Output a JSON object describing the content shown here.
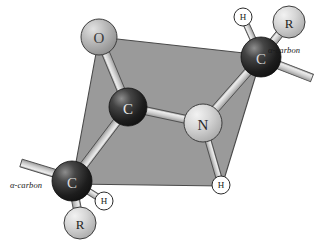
{
  "figure": {
    "type": "molecular-structure-diagram",
    "background_color": "#ffffff"
  },
  "plane": {
    "name": "peptide-plane",
    "fill_color": "#9a9a9a",
    "stroke_color": "#4a4a4a",
    "vertices": [
      [
        99,
        37
      ],
      [
        262,
        55
      ],
      [
        222,
        186
      ],
      [
        72,
        184
      ]
    ]
  },
  "atoms": [
    {
      "id": "o1",
      "label": "O",
      "kind": "oxygen",
      "x": 99,
      "y": 37,
      "r": 18,
      "fill": "#b3b3b3",
      "text_color": "#3a3a3a",
      "style": "sphere"
    },
    {
      "id": "c1",
      "label": "C",
      "kind": "carbonyl-carbon",
      "x": 128,
      "y": 107,
      "r": 19,
      "fill": "#2e2e2e",
      "text_color": "#e8e8e8",
      "style": "sphere-dark"
    },
    {
      "id": "n1",
      "label": "N",
      "kind": "nitrogen",
      "x": 203,
      "y": 123,
      "r": 19,
      "fill": "#c9c9c9",
      "text_color": "#2a2a2a",
      "style": "sphere"
    },
    {
      "id": "ca1",
      "label": "C",
      "kind": "alpha-carbon-upper",
      "x": 261,
      "y": 57,
      "r": 20,
      "fill": "#262626",
      "text_color": "#d8d8d8",
      "style": "sphere-dark"
    },
    {
      "id": "ca2",
      "label": "C",
      "kind": "alpha-carbon-lower",
      "x": 72,
      "y": 181,
      "r": 20,
      "fill": "#262626",
      "text_color": "#d8d8d8",
      "style": "sphere-dark"
    },
    {
      "id": "r1",
      "label": "R",
      "kind": "side-chain-upper",
      "x": 289,
      "y": 22,
      "r": 16,
      "fill": "#d0d0d0",
      "text_color": "#1f1f1f",
      "style": "sphere"
    },
    {
      "id": "r2",
      "label": "R",
      "kind": "side-chain-lower",
      "x": 80,
      "y": 223,
      "r": 16,
      "fill": "#d0d0d0",
      "text_color": "#1f1f1f",
      "style": "sphere"
    },
    {
      "id": "h1",
      "label": "H",
      "kind": "hydrogen-upper-alpha",
      "x": 243,
      "y": 17,
      "r": 9,
      "fill": "#ffffff",
      "text_color": "#1a1a1a",
      "style": "circle"
    },
    {
      "id": "h2",
      "label": "H",
      "kind": "hydrogen-amide",
      "x": 221,
      "y": 185,
      "r": 9,
      "fill": "#ffffff",
      "text_color": "#1a1a1a",
      "style": "circle"
    },
    {
      "id": "h3",
      "label": "H",
      "kind": "hydrogen-lower-alpha",
      "x": 104,
      "y": 201,
      "r": 9,
      "fill": "#ffffff",
      "text_color": "#1a1a1a",
      "style": "circle"
    }
  ],
  "bonds": [
    {
      "from": "c1",
      "to": "o1",
      "order": "double",
      "name": "carbonyl-bond"
    },
    {
      "from": "c1",
      "to": "n1",
      "order": "single",
      "name": "peptide-bond"
    },
    {
      "from": "c1",
      "to": "ca2",
      "order": "single",
      "name": "c-alpha-lower-bond"
    },
    {
      "from": "n1",
      "to": "ca1",
      "order": "single",
      "name": "n-alpha-upper-bond"
    },
    {
      "from": "n1",
      "to": "h2",
      "order": "single",
      "name": "n-h-bond"
    },
    {
      "from": "ca1",
      "to": "h1",
      "order": "single",
      "name": "alpha-upper-h-bond"
    },
    {
      "from": "ca1",
      "to": "r1",
      "order": "single",
      "name": "alpha-upper-r-bond"
    },
    {
      "from": "ca2",
      "to": "h3",
      "order": "single",
      "name": "alpha-lower-h-bond"
    },
    {
      "from": "ca2",
      "to": "r2",
      "order": "single",
      "name": "alpha-lower-r-bond"
    }
  ],
  "free_bonds": [
    {
      "name": "alpha-upper-free-bond",
      "x1": 276,
      "y1": 64,
      "x2": 312,
      "y2": 78
    },
    {
      "name": "alpha-lower-free-bond",
      "x1": 57,
      "y1": 174,
      "x2": 21,
      "y2": 163
    }
  ],
  "labels": {
    "alpha_carbon_upper": "α-carbon",
    "alpha_carbon_lower": "α-carbon"
  },
  "colors": {
    "plane_fill": "#9a9a9a",
    "plane_stroke": "#4a4a4a",
    "bond_fill": "#c6c6c6",
    "bond_stroke": "#4f4f4f",
    "text": "#1a1a1a"
  }
}
